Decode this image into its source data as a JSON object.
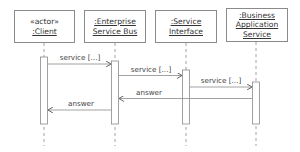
{
  "diagram": {
    "type": "uml-sequence",
    "participants": [
      {
        "id": "client",
        "stereotype": "«actor»",
        "lines": [
          ":Client"
        ]
      },
      {
        "id": "esb",
        "stereotype": "",
        "lines": [
          ":Enterprise",
          "Service Bus"
        ]
      },
      {
        "id": "si",
        "stereotype": "",
        "lines": [
          ":Service",
          "Interface"
        ]
      },
      {
        "id": "bas",
        "stereotype": "",
        "lines": [
          ":Business",
          "Application",
          "Service"
        ]
      }
    ],
    "messages": [
      {
        "from": "client",
        "to": "esb",
        "label": "service [...]",
        "kind": "call"
      },
      {
        "from": "esb",
        "to": "si",
        "label": "service [...]",
        "kind": "call"
      },
      {
        "from": "si",
        "to": "bas",
        "label": "service [...]",
        "kind": "call"
      },
      {
        "from": "bas",
        "to": "esb",
        "label": "answer",
        "kind": "return"
      },
      {
        "from": "esb",
        "to": "client",
        "label": "answer",
        "kind": "return"
      }
    ],
    "colors": {
      "line": "#8a8a8a",
      "text": "#333333",
      "background": "#ffffff"
    }
  }
}
